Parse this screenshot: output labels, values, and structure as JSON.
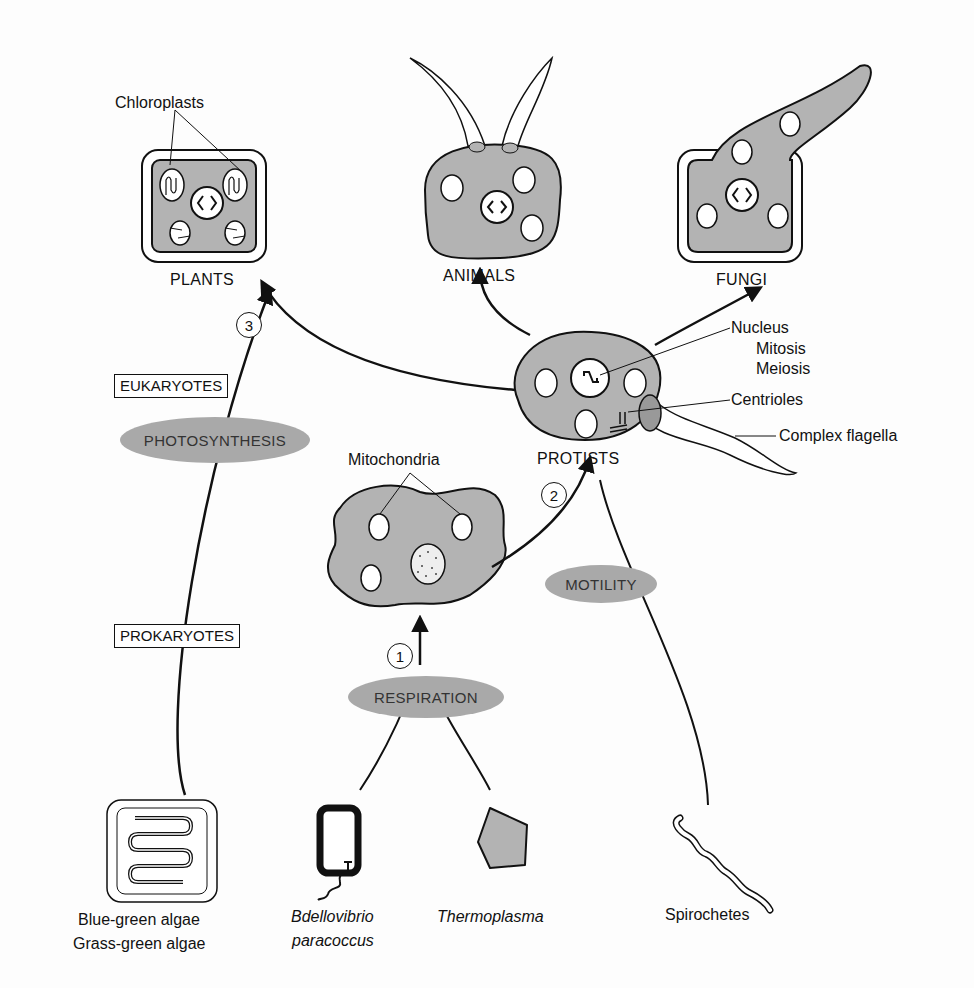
{
  "groups": {
    "eukaryotes": "EUKARYOTES",
    "prokaryotes": "PROKARYOTES"
  },
  "kingdoms": {
    "plants": "PLANTS",
    "animals": "ANIMALS",
    "fungi": "FUNGI",
    "protists": "PROTISTS"
  },
  "processes": {
    "photosynthesis": "PHOTOSYNTHESIS",
    "respiration": "RESPIRATION",
    "motility": "MOTILITY"
  },
  "steps": [
    "1",
    "2",
    "3"
  ],
  "annotations": {
    "chloroplasts": "Chloroplasts",
    "mitochondria": "Mitochondria",
    "nucleus": "Nucleus",
    "mitosis": "Mitosis",
    "meiosis": "Meiosis",
    "centrioles": "Centrioles",
    "complex_flagella": "Complex flagella"
  },
  "prokaryote_organisms": [
    {
      "line1": "Blue-green algae",
      "line2": "Grass-green algae"
    },
    {
      "line1": "Bdellovibrio",
      "line2": "paracoccus"
    },
    {
      "line1": "Thermoplasma"
    },
    {
      "line1": "Spirochetes"
    }
  ],
  "colors": {
    "cell_fill": "#b3b3b3",
    "oval_fill": "#a9a9a9",
    "line": "#111111"
  }
}
